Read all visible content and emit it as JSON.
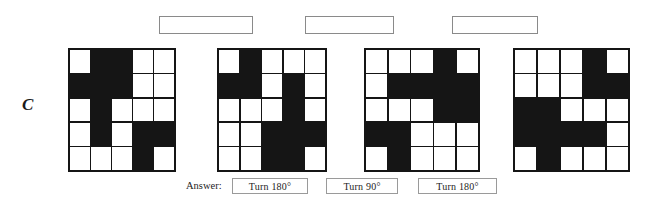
{
  "item": {
    "label": "C"
  },
  "blank_boxes": [
    {
      "name": "blank-answer-box-1",
      "value": ""
    },
    {
      "name": "blank-answer-box-2",
      "value": ""
    },
    {
      "name": "blank-answer-box-3",
      "value": ""
    }
  ],
  "answer_row": {
    "label": "Answer:",
    "boxes": [
      {
        "value": "Turn 180°"
      },
      {
        "value": "Turn 90°"
      },
      {
        "value": "Turn 180°"
      }
    ]
  },
  "colors": {
    "filled_cell": "#151515",
    "empty_cell": "#ffffff",
    "grid_line": "#151515",
    "box_border": "#8a8a8a",
    "text": "#1d1d1d",
    "page_background": "#ffffff"
  },
  "chart_data": {
    "type": "heatmap",
    "title": "",
    "xlabel": "",
    "ylabel": "",
    "rows": 5,
    "cols": 5,
    "legend": {
      "1": "filled-black",
      "0": "empty-white"
    },
    "series": [
      {
        "name": "grid-1",
        "values": [
          [
            0,
            1,
            1,
            0,
            0
          ],
          [
            1,
            1,
            1,
            0,
            0
          ],
          [
            0,
            1,
            0,
            0,
            0
          ],
          [
            0,
            1,
            0,
            1,
            1
          ],
          [
            0,
            0,
            0,
            1,
            0
          ]
        ]
      },
      {
        "name": "grid-2",
        "values": [
          [
            0,
            1,
            0,
            0,
            0
          ],
          [
            1,
            1,
            0,
            1,
            0
          ],
          [
            0,
            0,
            0,
            1,
            0
          ],
          [
            0,
            0,
            1,
            1,
            1
          ],
          [
            0,
            0,
            1,
            1,
            0
          ]
        ]
      },
      {
        "name": "grid-3",
        "values": [
          [
            0,
            0,
            0,
            1,
            0
          ],
          [
            0,
            1,
            1,
            1,
            1
          ],
          [
            0,
            0,
            0,
            1,
            1
          ],
          [
            1,
            1,
            0,
            0,
            0
          ],
          [
            0,
            1,
            0,
            0,
            0
          ]
        ]
      },
      {
        "name": "grid-4",
        "values": [
          [
            0,
            0,
            0,
            1,
            0
          ],
          [
            0,
            0,
            0,
            1,
            1
          ],
          [
            1,
            1,
            0,
            0,
            0
          ],
          [
            1,
            1,
            1,
            1,
            0
          ],
          [
            0,
            1,
            0,
            0,
            0
          ]
        ]
      }
    ]
  }
}
